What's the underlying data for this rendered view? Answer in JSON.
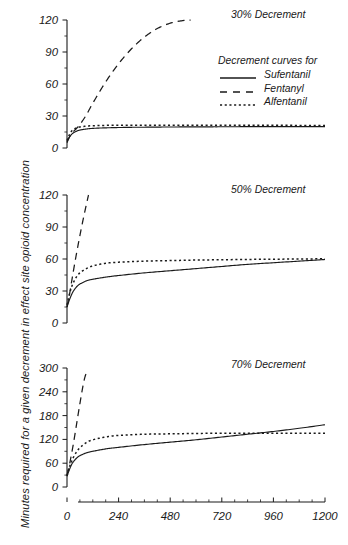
{
  "figure": {
    "ylabel": "Minutes required for a given decrement in effect site opioid concentration",
    "xlabel": ""
  },
  "legend": {
    "title": "Decrement curves for",
    "entries": [
      {
        "label": "Sufentanil",
        "style": "solid"
      },
      {
        "label": "Fentanyl",
        "style": "dashed"
      },
      {
        "label": "Alfentanil",
        "style": "dotted"
      }
    ]
  },
  "panels": [
    {
      "title": "30% Decrement",
      "ylim": [
        0,
        120
      ],
      "yticks": [
        "0",
        "30",
        "60",
        "90",
        "120"
      ],
      "ytick_values": [
        0,
        30,
        60,
        90,
        120
      ]
    },
    {
      "title": "50% Decrement",
      "ylim": [
        0,
        120
      ],
      "yticks": [
        "0",
        "30",
        "60",
        "90",
        "120"
      ],
      "ytick_values": [
        0,
        30,
        60,
        90,
        120
      ]
    },
    {
      "title": "70% Decrement",
      "ylim": [
        0,
        300
      ],
      "yticks": [
        "0",
        "60",
        "120",
        "180",
        "240",
        "300"
      ],
      "ytick_values": [
        0,
        60,
        120,
        180,
        240,
        300
      ]
    }
  ],
  "xaxis": {
    "ticks": [
      "0",
      "240",
      "480",
      "720",
      "960",
      "1200"
    ],
    "tick_values": [
      0,
      240,
      480,
      720,
      960,
      1200
    ],
    "xlim": [
      0,
      1200
    ],
    "minor_step": 60
  },
  "chart_data": {
    "type": "line",
    "title": "",
    "xlabel": "",
    "ylabel": "Minutes required for a given decrement in effect site opioid concentration",
    "xlim": [
      0,
      1200
    ],
    "grid": false,
    "legend_position": "upper-right-panel-1",
    "panels": [
      {
        "title": "30% Decrement",
        "ylim": [
          0,
          120
        ],
        "yticks": [
          0,
          30,
          60,
          90,
          120
        ],
        "series": [
          {
            "name": "Sufentanil",
            "style": "solid",
            "x": [
              0,
              10,
              20,
              30,
              45,
              60,
              90,
              120,
              180,
              240,
              300,
              360,
              480,
              600,
              720,
              840,
              960,
              1080,
              1200
            ],
            "y": [
              5,
              9.5,
              12.5,
              14.2,
              15.8,
              16.8,
              17.8,
              18.4,
              18.9,
              19.2,
              19.4,
              19.5,
              19.7,
              19.8,
              19.9,
              20,
              20,
              20,
              20
            ]
          },
          {
            "name": "Fentanyl",
            "style": "dashed",
            "x": [
              0,
              10,
              20,
              30,
              45,
              60,
              90,
              120,
              180,
              240,
              300,
              360,
              420,
              480,
              540,
              575
            ],
            "y": [
              6,
              10,
              13,
              15.5,
              18.5,
              22,
              31,
              42,
              62,
              79,
              93,
              104,
              112,
              117,
              119.5,
              120
            ]
          },
          {
            "name": "Alfentanil",
            "style": "dotted",
            "x": [
              0,
              10,
              20,
              30,
              45,
              60,
              90,
              120,
              180,
              240,
              300,
              360,
              480,
              600,
              720,
              840,
              960,
              1080,
              1200
            ],
            "y": [
              7,
              12,
              15.5,
              17.3,
              18.9,
              19.7,
              20.5,
              20.9,
              21.2,
              21.3,
              21.4,
              21.4,
              21.4,
              21.4,
              21.4,
              21.3,
              21.3,
              21.2,
              21.2
            ]
          }
        ]
      },
      {
        "title": "50% Decrement",
        "ylim": [
          0,
          120
        ],
        "yticks": [
          0,
          30,
          60,
          90,
          120
        ],
        "series": [
          {
            "name": "Sufentanil",
            "style": "solid",
            "x": [
              0,
              10,
              20,
              30,
              45,
              60,
              90,
              120,
              180,
              240,
              360,
              480,
              600,
              720,
              840,
              960,
              1080,
              1200
            ],
            "y": [
              15,
              21,
              26,
              30,
              34,
              36.5,
              39.5,
              41,
              43,
              44.5,
              47,
              49,
              51,
              53,
              55,
              56.5,
              58,
              59.5
            ]
          },
          {
            "name": "Fentanyl",
            "style": "dashed",
            "x": [
              0,
              10,
              20,
              30,
              45,
              60,
              75,
              90,
              100
            ],
            "y": [
              15,
              25,
              37,
              49,
              66,
              82,
              97,
              111,
              120
            ]
          },
          {
            "name": "Alfentanil",
            "style": "dotted",
            "x": [
              0,
              10,
              20,
              30,
              45,
              60,
              90,
              120,
              180,
              240,
              360,
              480,
              600,
              720,
              840,
              960,
              1080,
              1200
            ],
            "y": [
              17,
              26,
              33,
              38,
              43.5,
              47,
              51,
              53.5,
              56,
              57,
              58,
              58.5,
              59,
              59.3,
              59.6,
              59.8,
              60,
              60.2
            ]
          }
        ]
      },
      {
        "title": "70% Decrement",
        "ylim": [
          0,
          300
        ],
        "yticks": [
          0,
          60,
          120,
          180,
          240,
          300
        ],
        "series": [
          {
            "name": "Sufentanil",
            "style": "solid",
            "x": [
              0,
              10,
              20,
              30,
              45,
              60,
              90,
              120,
              180,
              240,
              360,
              480,
              600,
              720,
              840,
              960,
              1080,
              1200
            ],
            "y": [
              27,
              42,
              55,
              64,
              73,
              79,
              86,
              90,
              96,
              100,
              107,
              113,
              119,
              126,
              133,
              140,
              148,
              157
            ]
          },
          {
            "name": "Fentanyl",
            "style": "dashed",
            "x": [
              0,
              10,
              20,
              30,
              40,
              50,
              60,
              70,
              80,
              88
            ],
            "y": [
              30,
              53,
              80,
              110,
              143,
              177,
              210,
              242,
              270,
              285
            ]
          },
          {
            "name": "Alfentanil",
            "style": "dotted",
            "x": [
              0,
              10,
              20,
              30,
              45,
              60,
              90,
              120,
              180,
              240,
              360,
              480,
              600,
              720,
              840,
              960,
              1080,
              1200
            ],
            "y": [
              28,
              48,
              63,
              75,
              89,
              99,
              112,
              119,
              126,
              130,
              133,
              134,
              135,
              135.5,
              135.5,
              135.5,
              135.5,
              135.5
            ]
          }
        ]
      }
    ]
  }
}
